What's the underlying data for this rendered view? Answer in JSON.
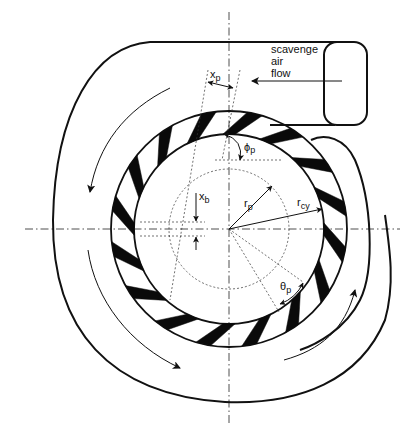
{
  "diagram": {
    "inlet": {
      "label_line1": "scavenge",
      "label_line2": "air",
      "label_line3": "flow"
    },
    "labels": {
      "x_p": "x",
      "x_p_sub": "p",
      "phi_p": "ϕ",
      "phi_p_sub": "p",
      "x_b": "x",
      "x_b_sub": "b",
      "r_p": "r",
      "r_p_sub": "p",
      "r_cy": "r",
      "r_cy_sub": "cy",
      "theta_p": "θ",
      "theta_p_sub": "p"
    },
    "geometry": {
      "center": [
        229,
        229
      ],
      "inner_radius": 95,
      "outer_radius": 118,
      "dotted_radius": 60,
      "port_count": 16
    },
    "colors": {
      "line": "#111111",
      "port_fill": "#0a0a0a",
      "background": "#ffffff"
    }
  }
}
